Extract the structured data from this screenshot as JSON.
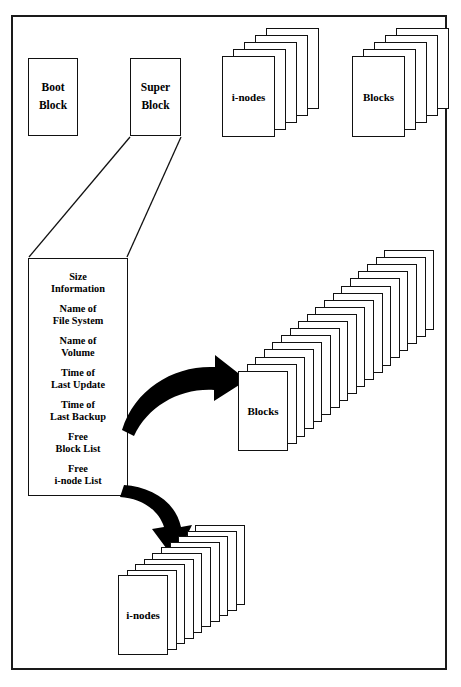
{
  "diagram": {
    "frame": {
      "stroke": "#1a1a1a"
    },
    "top_row": {
      "boot_block": {
        "line1": "Boot",
        "line2": "Block"
      },
      "super_block": {
        "line1": "Super",
        "line2": "Block"
      },
      "inodes_stack": {
        "label": "i-nodes",
        "card_count": 5
      },
      "blocks_stack": {
        "label": "Blocks",
        "card_count": 5
      }
    },
    "super_block_detail": {
      "fields": [
        {
          "line1": "Size",
          "line2": "Information"
        },
        {
          "line1": "Name of",
          "line2": "File System"
        },
        {
          "line1": "Name of",
          "line2": "Volume"
        },
        {
          "line1": "Time of",
          "line2": "Last Update"
        },
        {
          "line1": "Time of",
          "line2": "Last Backup"
        },
        {
          "line1": "Free",
          "line2": "Block List"
        },
        {
          "line1": "Free",
          "line2": "i-node List"
        }
      ]
    },
    "data_blocks_stack": {
      "label": "Blocks",
      "card_count": 18
    },
    "data_inodes_stack": {
      "label": "i-nodes",
      "card_count": 10
    },
    "arrows": [
      {
        "name": "free-block-list-arrow",
        "from": "Free Block List",
        "to": "Blocks"
      },
      {
        "name": "free-inode-list-arrow",
        "from": "Free i-node List",
        "to": "i-nodes"
      }
    ],
    "connectors": [
      {
        "name": "super-block-left-connector"
      },
      {
        "name": "super-block-right-connector"
      }
    ],
    "colors": {
      "ink": "#000000",
      "paper": "#ffffff"
    }
  }
}
